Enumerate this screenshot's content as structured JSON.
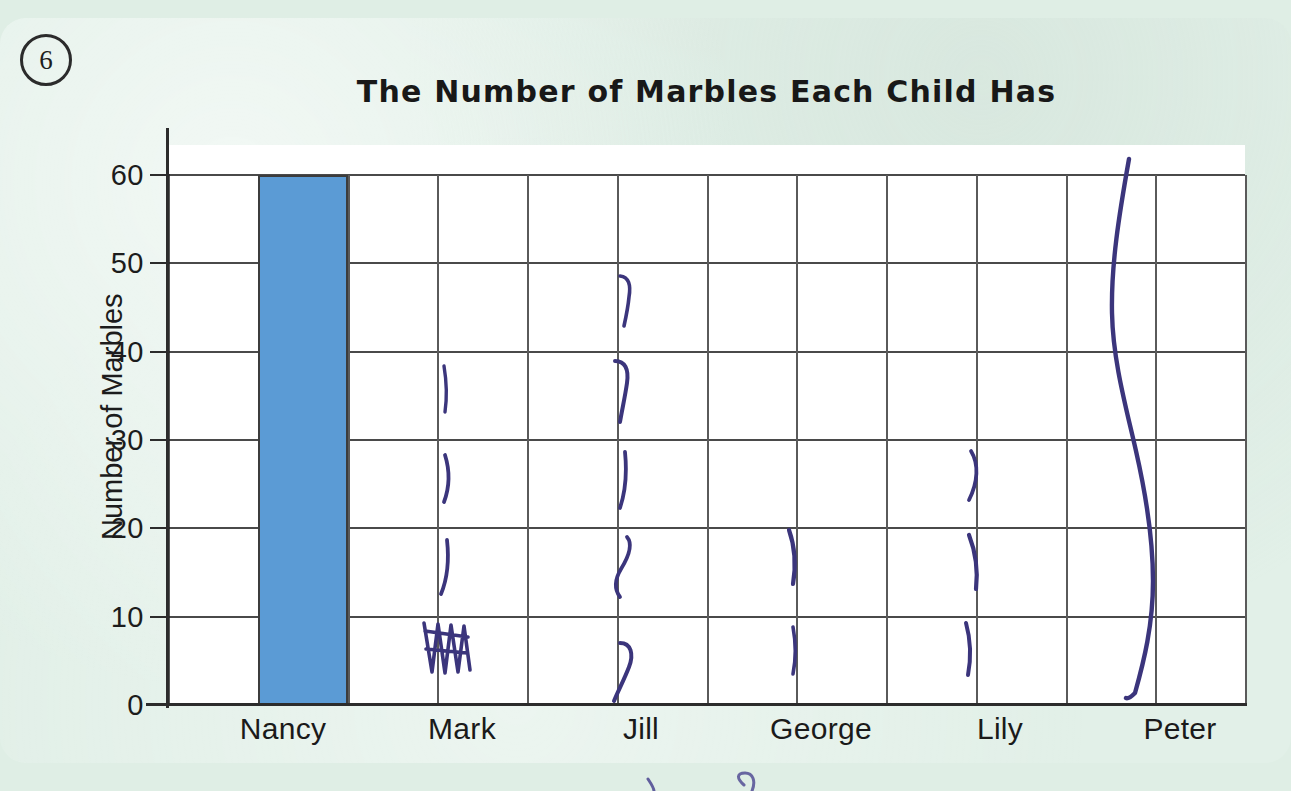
{
  "worksheet": {
    "question_number": "6",
    "background_color": "#dfeee5"
  },
  "chart_data": {
    "type": "bar",
    "title": "The Number of Marbles Each Child Has",
    "xlabel": "",
    "ylabel": "Number of Marbles",
    "categories": [
      "Nancy",
      "Mark",
      "Jill",
      "George",
      "Lily",
      "Peter"
    ],
    "values": [
      60,
      null,
      null,
      null,
      null,
      null
    ],
    "bar_color": "#5b9bd5",
    "ylim": [
      0,
      60
    ],
    "ytick_labels": [
      "0",
      "10",
      "20",
      "30",
      "40",
      "50",
      "60"
    ],
    "ytick_values": [
      0,
      10,
      20,
      30,
      40,
      50,
      60
    ],
    "grid": true,
    "legend": "none",
    "note": "Only Nancy's bar is drawn (60). Remaining columns contain hand-drawn pen tally marks rather than bars."
  },
  "axis": {
    "y_title": "Number of Marbles",
    "ticks": [
      {
        "label": "60",
        "value": 60
      },
      {
        "label": "50",
        "value": 50
      },
      {
        "label": "40",
        "value": 40
      },
      {
        "label": "30",
        "value": 30
      },
      {
        "label": "20",
        "value": 20
      },
      {
        "label": "10",
        "value": 10
      },
      {
        "label": "0",
        "value": 0
      }
    ]
  },
  "bars": [
    {
      "name": "Nancy",
      "value": 60,
      "color": "#5b9bd5",
      "drawn": true
    }
  ],
  "x_labels": [
    {
      "label": "Nancy",
      "center": 283
    },
    {
      "label": "Mark",
      "center": 462
    },
    {
      "label": "Jill",
      "center": 641
    },
    {
      "label": "George",
      "center": 821
    },
    {
      "label": "Lily",
      "center": 1000
    },
    {
      "label": "Peter",
      "center": 1180
    }
  ],
  "handwriting": {
    "ink_color": "#3b357c",
    "marks": [
      {
        "owner": "Mark",
        "approx_value": 34,
        "kind": "tally-stroke"
      },
      {
        "owner": "Mark",
        "approx_value": 24,
        "kind": "tally-stroke"
      },
      {
        "owner": "Mark",
        "approx_value": 15,
        "kind": "tally-stroke"
      },
      {
        "owner": "Mark",
        "approx_value": 6,
        "kind": "scribble"
      },
      {
        "owner": "Jill",
        "approx_value": 46,
        "kind": "tally-stroke"
      },
      {
        "owner": "Jill",
        "approx_value": 36,
        "kind": "tally-stroke"
      },
      {
        "owner": "Jill",
        "approx_value": 25,
        "kind": "tally-stroke"
      },
      {
        "owner": "Jill",
        "approx_value": 15,
        "kind": "tally-stroke"
      },
      {
        "owner": "Jill",
        "approx_value": 4,
        "kind": "tally-stroke"
      },
      {
        "owner": "George",
        "approx_value": 16,
        "kind": "tally-stroke"
      },
      {
        "owner": "George",
        "approx_value": 5,
        "kind": "tally-stroke"
      },
      {
        "owner": "Lily",
        "approx_value": 25,
        "kind": "tally-stroke"
      },
      {
        "owner": "Lily",
        "approx_value": 15,
        "kind": "tally-stroke"
      },
      {
        "owner": "Lily",
        "approx_value": 6,
        "kind": "tally-stroke"
      },
      {
        "owner": "Peter",
        "approx_value": 62,
        "kind": "long-wavy-stroke"
      }
    ]
  }
}
